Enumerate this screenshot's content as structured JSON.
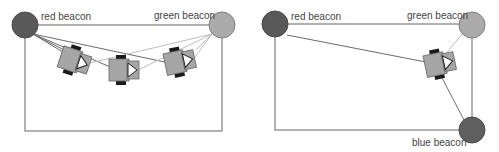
{
  "colors": {
    "red_beacon": "#595959",
    "green_beacon": "#ababab",
    "blue_beacon": "#5f5f5f",
    "frame": "#7f7f7f",
    "red_line": "#6b6b6b",
    "green_line": "#bdbdbd",
    "blue_line": "#6f6f6f",
    "robot_body": "#a6a6a6",
    "robot_wheel": "#1a1a1a",
    "robot_arrow": "#ffffff"
  },
  "panels": [
    {
      "id": "left",
      "beacons": [
        {
          "name": "red",
          "label": "red beacon",
          "cx": 25,
          "cy": 25,
          "r": 13
        },
        {
          "name": "green",
          "label": "green beacon",
          "cx": 222,
          "cy": 25,
          "r": 13
        }
      ],
      "frame": {
        "x1": 25,
        "y1": 25,
        "x2": 222,
        "y2": 131
      },
      "robots": [
        {
          "x": 72,
          "y": 60,
          "angle": 18
        },
        {
          "x": 122,
          "y": 70,
          "angle": 0
        },
        {
          "x": 178,
          "y": 62,
          "angle": -12
        }
      ]
    },
    {
      "id": "right",
      "beacons": [
        {
          "name": "red",
          "label": "red beacon",
          "cx": 25,
          "cy": 24,
          "r": 13
        },
        {
          "name": "green",
          "label": "green beacon",
          "cx": 222,
          "cy": 25,
          "r": 13
        },
        {
          "name": "blue",
          "label": "blue beacon",
          "cx": 222,
          "cy": 130,
          "r": 13
        }
      ],
      "frame": {
        "x1": 25,
        "y1": 24,
        "x2": 222,
        "y2": 130
      },
      "robots": [
        {
          "x": 188,
          "y": 64,
          "angle": -12
        }
      ]
    }
  ]
}
